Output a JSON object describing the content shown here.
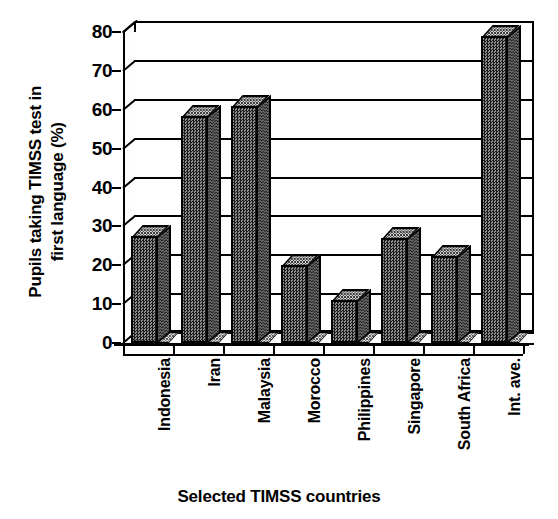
{
  "chart_data": {
    "type": "bar",
    "title": "",
    "xlabel": "Selected TIMSS countries",
    "ylabel": "Pupils taking TIMSS test in first language (%)",
    "ylabel_lines": [
      "Pupils taking TIMSS test in",
      "first language (%)"
    ],
    "categories": [
      "Indonesia",
      "Iran",
      "Malaysia",
      "Morocco",
      "Philippines",
      "Singapore",
      "South Africa",
      "Int. ave."
    ],
    "values": [
      27.5,
      58.5,
      61,
      20,
      11,
      27,
      22.5,
      79
    ],
    "ylim": [
      0,
      80
    ],
    "yticks": [
      0,
      10,
      20,
      30,
      40,
      50,
      60,
      70,
      80
    ],
    "ytick_labels": [
      "0",
      "10",
      "20",
      "30",
      "40",
      "50",
      "60",
      "70",
      "80"
    ],
    "grid": true,
    "legend": false,
    "style": "3d-column",
    "series": [
      {
        "name": "Pupils taking TIMSS test in first language (%)",
        "values": [
          27.5,
          58.5,
          61,
          20,
          11,
          27,
          22.5,
          79
        ]
      }
    ],
    "colors": {
      "bar_front": "#4a4a4a",
      "bar_side": "#2b2b2b",
      "bar_top": "#9a9a9a",
      "axis": "#000000",
      "background": "#ffffff"
    }
  }
}
